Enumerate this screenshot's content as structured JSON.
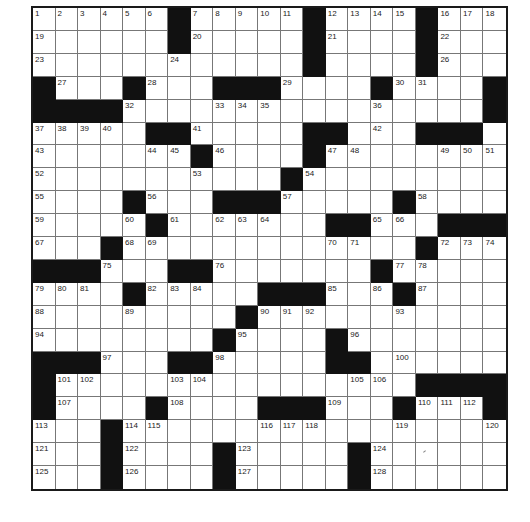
{
  "puzzle": {
    "rows": 21,
    "cols": 21,
    "colors": {
      "block": "#111111",
      "cell": "#ffffff",
      "grid_line": "#777777",
      "border": "#1a1a1a"
    },
    "layout": [
      "......#.....#....#...",
      "......#.....#....#...",
      "............#....#...",
      "#...#...###....#....#",
      "####................#",
      ".....##.....##...###.",
      ".......#....#........",
      "...........#.........",
      "....#...###.....#....",
      ".....#.......##...###",
      "...#.............#...",
      "###...##.......#.....",
      "....#.....###...#....",
      ".........#...........",
      "........#....#.......",
      "###...##.....##......",
      "#................####",
      "#....#....###...#...#",
      "...#.................",
      "...#....#.....#......",
      "...#....#.....#......"
    ],
    "numbers": [
      [
        0,
        0,
        1
      ],
      [
        0,
        1,
        2
      ],
      [
        0,
        2,
        3
      ],
      [
        0,
        3,
        4
      ],
      [
        0,
        4,
        5
      ],
      [
        0,
        5,
        6
      ],
      [
        0,
        7,
        7
      ],
      [
        0,
        8,
        8
      ],
      [
        0,
        9,
        9
      ],
      [
        0,
        10,
        10
      ],
      [
        0,
        11,
        11
      ],
      [
        0,
        13,
        12
      ],
      [
        0,
        14,
        13
      ],
      [
        0,
        15,
        14
      ],
      [
        0,
        16,
        15
      ],
      [
        0,
        18,
        16
      ],
      [
        0,
        19,
        17
      ],
      [
        0,
        20,
        18
      ],
      [
        1,
        0,
        19
      ],
      [
        1,
        7,
        20
      ],
      [
        1,
        13,
        21
      ],
      [
        1,
        18,
        22
      ],
      [
        2,
        0,
        23
      ],
      [
        2,
        6,
        24
      ],
      [
        2,
        12,
        25
      ],
      [
        2,
        18,
        26
      ],
      [
        3,
        1,
        27
      ],
      [
        3,
        5,
        28
      ],
      [
        3,
        11,
        29
      ],
      [
        3,
        16,
        30
      ],
      [
        3,
        17,
        31
      ],
      [
        4,
        4,
        32
      ],
      [
        4,
        8,
        33
      ],
      [
        4,
        9,
        34
      ],
      [
        4,
        10,
        35
      ],
      [
        4,
        15,
        36
      ],
      [
        5,
        0,
        37
      ],
      [
        5,
        1,
        38
      ],
      [
        5,
        2,
        39
      ],
      [
        5,
        3,
        40
      ],
      [
        5,
        7,
        41
      ],
      [
        5,
        15,
        42
      ],
      [
        6,
        0,
        43
      ],
      [
        6,
        5,
        44
      ],
      [
        6,
        6,
        45
      ],
      [
        6,
        8,
        46
      ],
      [
        6,
        13,
        47
      ],
      [
        6,
        14,
        48
      ],
      [
        6,
        18,
        49
      ],
      [
        6,
        19,
        50
      ],
      [
        6,
        20,
        51
      ],
      [
        7,
        0,
        52
      ],
      [
        7,
        7,
        53
      ],
      [
        7,
        12,
        54
      ],
      [
        8,
        0,
        55
      ],
      [
        8,
        5,
        56
      ],
      [
        8,
        11,
        57
      ],
      [
        8,
        17,
        58
      ],
      [
        9,
        0,
        59
      ],
      [
        9,
        4,
        60
      ],
      [
        9,
        6,
        61
      ],
      [
        9,
        8,
        62
      ],
      [
        9,
        9,
        63
      ],
      [
        9,
        10,
        64
      ],
      [
        9,
        15,
        65
      ],
      [
        9,
        16,
        66
      ],
      [
        10,
        0,
        67
      ],
      [
        10,
        4,
        68
      ],
      [
        10,
        5,
        69
      ],
      [
        10,
        13,
        70
      ],
      [
        10,
        14,
        71
      ],
      [
        10,
        18,
        72
      ],
      [
        10,
        19,
        73
      ],
      [
        10,
        20,
        74
      ],
      [
        11,
        3,
        75
      ],
      [
        11,
        8,
        76
      ],
      [
        11,
        16,
        77
      ],
      [
        11,
        17,
        78
      ],
      [
        12,
        0,
        79
      ],
      [
        12,
        1,
        80
      ],
      [
        12,
        2,
        81
      ],
      [
        12,
        5,
        82
      ],
      [
        12,
        6,
        83
      ],
      [
        12,
        7,
        84
      ],
      [
        12,
        13,
        85
      ],
      [
        12,
        15,
        86
      ],
      [
        12,
        17,
        87
      ],
      [
        13,
        0,
        88
      ],
      [
        13,
        4,
        89
      ],
      [
        13,
        10,
        90
      ],
      [
        13,
        11,
        91
      ],
      [
        13,
        12,
        92
      ],
      [
        13,
        16,
        93
      ],
      [
        14,
        0,
        94
      ],
      [
        14,
        9,
        95
      ],
      [
        14,
        14,
        96
      ],
      [
        15,
        3,
        97
      ],
      [
        15,
        8,
        98
      ],
      [
        15,
        13,
        99
      ],
      [
        15,
        16,
        100
      ],
      [
        16,
        1,
        101
      ],
      [
        16,
        2,
        102
      ],
      [
        16,
        6,
        103
      ],
      [
        16,
        7,
        104
      ],
      [
        16,
        14,
        105
      ],
      [
        16,
        15,
        106
      ],
      [
        17,
        1,
        107
      ],
      [
        17,
        6,
        108
      ],
      [
        17,
        13,
        109
      ],
      [
        17,
        17,
        110
      ],
      [
        17,
        18,
        111
      ],
      [
        17,
        19,
        112
      ],
      [
        18,
        0,
        113
      ],
      [
        18,
        4,
        114
      ],
      [
        18,
        5,
        115
      ],
      [
        18,
        10,
        116
      ],
      [
        18,
        11,
        117
      ],
      [
        18,
        12,
        118
      ],
      [
        18,
        16,
        119
      ],
      [
        18,
        20,
        120
      ],
      [
        19,
        0,
        121
      ],
      [
        19,
        4,
        122
      ],
      [
        19,
        9,
        123
      ],
      [
        19,
        15,
        124
      ],
      [
        20,
        0,
        125
      ],
      [
        20,
        4,
        126
      ],
      [
        20,
        9,
        127
      ],
      [
        20,
        15,
        128
      ]
    ]
  }
}
